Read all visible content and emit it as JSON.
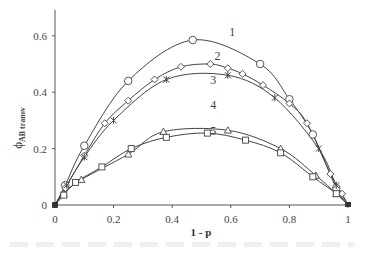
{
  "chart_data": {
    "type": "line",
    "title": "",
    "xlabel": "1 - p",
    "ylabel": "ϕ_AB transv",
    "xlim": [
      0,
      1
    ],
    "ylim": [
      0,
      0.7
    ],
    "xticks": [
      0,
      0.2,
      0.4,
      0.6,
      0.8,
      1
    ],
    "xtick_labels": [
      "0",
      "0.2",
      "0.4",
      "0.6",
      "0.8",
      "1"
    ],
    "yticks": [
      0,
      0.2,
      0.4,
      0.6
    ],
    "ytick_labels": [
      "0",
      "0.2",
      "0.4",
      "0.6"
    ],
    "grid": false,
    "legend": "inline numeric labels 1-5",
    "series": [
      {
        "name": "1",
        "marker": "circle",
        "label_pos": [
          0.605,
          0.6
        ],
        "points": [
          [
            0,
            0
          ],
          [
            0.035,
            0.07
          ],
          [
            0.1,
            0.21
          ],
          [
            0.25,
            0.44
          ],
          [
            0.47,
            0.585
          ],
          [
            0.7,
            0.5
          ],
          [
            0.8,
            0.375
          ],
          [
            0.88,
            0.25
          ],
          [
            0.96,
            0.06
          ],
          [
            1,
            0
          ]
        ]
      },
      {
        "name": "2",
        "marker": "diamond",
        "label_pos": [
          0.555,
          0.515
        ],
        "points": [
          [
            0,
            0
          ],
          [
            0.035,
            0.06
          ],
          [
            0.1,
            0.175
          ],
          [
            0.17,
            0.29
          ],
          [
            0.25,
            0.37
          ],
          [
            0.34,
            0.445
          ],
          [
            0.43,
            0.49
          ],
          [
            0.53,
            0.5
          ],
          [
            0.59,
            0.485
          ],
          [
            0.64,
            0.465
          ],
          [
            0.71,
            0.425
          ],
          [
            0.8,
            0.36
          ],
          [
            0.86,
            0.29
          ],
          [
            0.94,
            0.11
          ],
          [
            0.98,
            0.04
          ],
          [
            1,
            0
          ]
        ]
      },
      {
        "name": "3",
        "marker": "star",
        "label_pos": [
          0.54,
          0.43
        ],
        "points": [
          [
            0,
            0
          ],
          [
            0.04,
            0.07
          ],
          [
            0.1,
            0.17
          ],
          [
            0.2,
            0.3
          ],
          [
            0.38,
            0.445
          ],
          [
            0.59,
            0.46
          ],
          [
            0.75,
            0.38
          ],
          [
            0.9,
            0.2
          ],
          [
            0.96,
            0.07
          ],
          [
            1,
            0
          ]
        ]
      },
      {
        "name": "4",
        "marker": "triangle",
        "label_pos": [
          0.54,
          0.34
        ],
        "points": [
          [
            0,
            0
          ],
          [
            0.03,
            0.04
          ],
          [
            0.09,
            0.09
          ],
          [
            0.25,
            0.18
          ],
          [
            0.37,
            0.26
          ],
          [
            0.59,
            0.265
          ],
          [
            0.77,
            0.2
          ],
          [
            0.89,
            0.105
          ],
          [
            0.96,
            0.04
          ],
          [
            1,
            0
          ]
        ]
      },
      {
        "name": "5",
        "marker": "square",
        "label_pos": [
          0.54,
          0.25
        ],
        "points": [
          [
            0,
            0
          ],
          [
            0.03,
            0.035
          ],
          [
            0.07,
            0.08
          ],
          [
            0.16,
            0.135
          ],
          [
            0.26,
            0.2
          ],
          [
            0.38,
            0.24
          ],
          [
            0.52,
            0.255
          ],
          [
            0.65,
            0.23
          ],
          [
            0.77,
            0.185
          ],
          [
            0.88,
            0.1
          ],
          [
            0.96,
            0.04
          ],
          [
            1,
            0
          ]
        ]
      }
    ]
  },
  "axes": {
    "xlabel": "1 - p",
    "ylabel_main": "ϕ",
    "ylabel_sub": "AB transv"
  }
}
